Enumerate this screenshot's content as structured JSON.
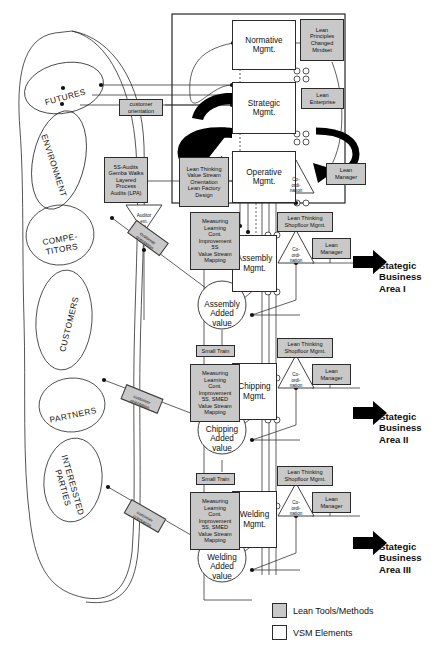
{
  "figure": {
    "caption": ""
  },
  "colors": {
    "lean_tool_fill": "#c8c8c8",
    "vsm_fill": "#ffffff",
    "stroke": "#2b2b2b",
    "arrow_black": "#000000"
  },
  "stakeholders": [
    {
      "id": "futures",
      "label": "FUTURES"
    },
    {
      "id": "environment",
      "label": "ENVIRONMENT"
    },
    {
      "id": "competitors",
      "label": "COMPE-\nTITORS"
    },
    {
      "id": "customers",
      "label": "CUSTOMERS"
    },
    {
      "id": "partners",
      "label": "PARTNERS"
    },
    {
      "id": "interested",
      "label": "INTERESSTED\nPARTIES"
    }
  ],
  "management_levels": [
    {
      "id": "normative",
      "label": "Normative\nMgmt."
    },
    {
      "id": "strategic",
      "label": "Strategic\nMgmt."
    },
    {
      "id": "operative",
      "label": "Operative\nMgmt."
    }
  ],
  "process_mgmt": [
    {
      "id": "assembly",
      "label": "Assembly\nMgmt."
    },
    {
      "id": "chipping",
      "label": "Chipping\nMgmt."
    },
    {
      "id": "welding",
      "label": "Welding\nMgmt."
    }
  ],
  "added_value": [
    {
      "id": "assembly_av",
      "label": "Assembly\nAdded\nvalue"
    },
    {
      "id": "chipping_av",
      "label": "Chipping\nAdded\nvalue"
    },
    {
      "id": "welding_av",
      "label": "Welding\nAdded\nvalue"
    }
  ],
  "coordination_triangles": [
    {
      "id": "coord_op",
      "label": "Co-\nordi-\nnation"
    },
    {
      "id": "coord_assembly",
      "label": "Co-\nordi-\nnation"
    },
    {
      "id": "coord_chipping",
      "label": "Co-\nordi-\nnation"
    },
    {
      "id": "coord_welding",
      "label": "Co-\nordi-\nnation"
    }
  ],
  "auditor": {
    "label": "Auditor\next.\nint."
  },
  "lean_tools": [
    {
      "id": "lean_principles",
      "label": "Lean\nPrinciples\nChanged\nMindset"
    },
    {
      "id": "lean_enterprise",
      "label": "Lean\nEnterprise"
    },
    {
      "id": "lean_manager_op",
      "label": "Lean\nManager"
    },
    {
      "id": "lean_manager_a",
      "label": "Lean\nManager"
    },
    {
      "id": "lean_manager_c",
      "label": "Lean\nManager"
    },
    {
      "id": "lean_manager_w",
      "label": "Lean\nManager"
    },
    {
      "id": "lean_thinking_op",
      "label": "Lean Thinking\nValue Stream\nOrientation\nLean Factory\nDesign"
    },
    {
      "id": "audits_box",
      "label": "5S-Audits\nGemba Walks\nLayered\nProcess\nAudits (LPA)"
    },
    {
      "id": "shopfloor_a",
      "label": "Lean Thinking\nShopfloor Mgmt."
    },
    {
      "id": "shopfloor_c",
      "label": "Lean Thinking\nShopfloor Mgmt."
    },
    {
      "id": "shopfloor_w",
      "label": "Lean Thinking\nShopfloor Mgmt."
    },
    {
      "id": "methods_a",
      "label": "Measuring\nLearning\nCont.\nImprovement\n5S\nValue Stream\nMapping"
    },
    {
      "id": "methods_c",
      "label": "Measuring\nLearning\nCont.\nImprovement\n5S, SMED\nValue Stream\nMapping"
    },
    {
      "id": "methods_w",
      "label": "Measuring\nLearning\nCont.\nImprovement\n5S, SMED\nValue Stream\nMapping"
    },
    {
      "id": "small_train_1",
      "label": "Small Train"
    },
    {
      "id": "small_train_2",
      "label": "Small Train"
    },
    {
      "id": "cust_orient_top",
      "label": "customer\norientation"
    },
    {
      "id": "cust_orient_1",
      "label": "customer\norientation"
    },
    {
      "id": "cust_orient_2",
      "label": "customer\norientation"
    },
    {
      "id": "cust_orient_3",
      "label": "customer\norientation"
    }
  ],
  "business_areas": [
    {
      "id": "sba1",
      "label": "Stategic\nBusiness\nArea I"
    },
    {
      "id": "sba2",
      "label": "Stategic\nBusiness\nArea II"
    },
    {
      "id": "sba3",
      "label": "Stategic\nBusiness\nArea III"
    }
  ],
  "legend": [
    {
      "id": "lean_tools_methods",
      "label": "Lean Tools/Methods",
      "swatch": "filled"
    },
    {
      "id": "vsm_elements",
      "label": "VSM Elements",
      "swatch": "empty"
    }
  ]
}
